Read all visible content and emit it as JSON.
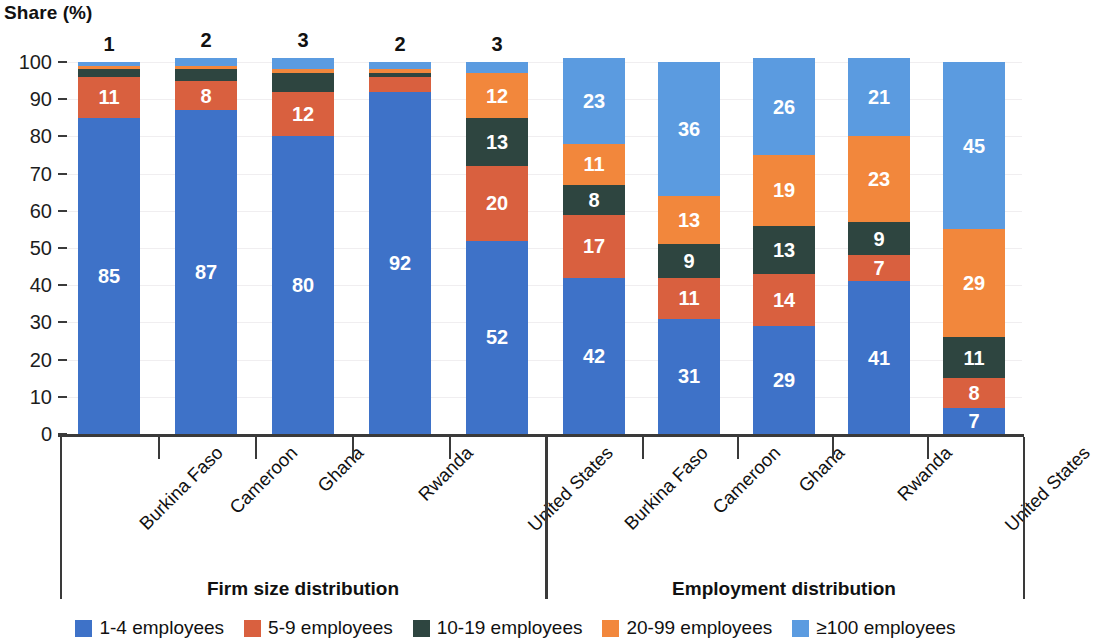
{
  "axis_title": "Share (%)",
  "groups": [
    {
      "id": "firm-size",
      "title": "Firm size distribution"
    },
    {
      "id": "employment",
      "title": "Employment distribution"
    }
  ],
  "legend": [
    {
      "label": "1-4 employees",
      "color": "#3e72c8",
      "key": "e1_4"
    },
    {
      "label": "5-9 employees",
      "color": "#d9603f",
      "key": "e5_9"
    },
    {
      "label": "10-19 employees",
      "color": "#2e4540",
      "key": "e10_19"
    },
    {
      "label": "20-99 employees",
      "color": "#f2873c",
      "key": "e20_99"
    },
    {
      "label": "≥100 employees",
      "color": "#5b9be0",
      "key": "e100"
    }
  ],
  "y_ticks": [
    "0",
    "10",
    "20",
    "30",
    "40",
    "50",
    "60",
    "70",
    "80",
    "90",
    "100"
  ],
  "chart_data": {
    "type": "bar",
    "subtype": "stacked-column",
    "title": "",
    "xlabel": "",
    "ylabel": "Share (%)",
    "ylim": [
      0,
      100
    ],
    "ytick_step": 10,
    "grid": true,
    "legend_position": "bottom",
    "stacked_order": [
      "1-4 employees",
      "5-9 employees",
      "10-19 employees",
      "20-99 employees",
      "≥100 employees"
    ],
    "panels": [
      {
        "name": "Firm size distribution",
        "categories": [
          "Burkina Faso",
          "Cameroon",
          "Ghana",
          "Rwanda",
          "United States"
        ],
        "series": [
          {
            "name": "1-4 employees",
            "color": "#3e72c8",
            "values": [
              85,
              87,
              80,
              92,
              52
            ]
          },
          {
            "name": "5-9 employees",
            "color": "#d9603f",
            "values": [
              11,
              8,
              12,
              4,
              20
            ]
          },
          {
            "name": "10-19 employees",
            "color": "#2e4540",
            "values": [
              2,
              3,
              5,
              1,
              13
            ]
          },
          {
            "name": "20-99 employees",
            "color": "#f2873c",
            "values": [
              1,
              1,
              1,
              1,
              12
            ]
          },
          {
            "name": "≥100 employees",
            "color": "#5b9be0",
            "values": [
              1,
              2,
              3,
              2,
              3
            ]
          }
        ],
        "labels_above_bar": [
          "1",
          "2",
          "3",
          "2",
          "3"
        ]
      },
      {
        "name": "Employment distribution",
        "categories": [
          "Burkina Faso",
          "Cameroon",
          "Ghana",
          "Rwanda",
          "United States"
        ],
        "series": [
          {
            "name": "1-4 employees",
            "color": "#3e72c8",
            "values": [
              42,
              31,
              29,
              41,
              7
            ]
          },
          {
            "name": "5-9 employees",
            "color": "#d9603f",
            "values": [
              17,
              11,
              14,
              7,
              8
            ]
          },
          {
            "name": "10-19 employees",
            "color": "#2e4540",
            "values": [
              8,
              9,
              13,
              9,
              11
            ]
          },
          {
            "name": "20-99 employees",
            "color": "#f2873c",
            "values": [
              11,
              13,
              19,
              23,
              29
            ]
          },
          {
            "name": "≥100 employees",
            "color": "#5b9be0",
            "values": [
              23,
              36,
              26,
              21,
              45
            ]
          }
        ],
        "labels_above_bar": [
          "",
          "",
          "",
          "",
          ""
        ]
      }
    ]
  }
}
